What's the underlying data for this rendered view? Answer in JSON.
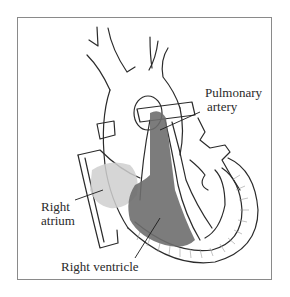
{
  "figure": {
    "labels": {
      "pulmonary_artery": [
        "Pulmonary",
        "artery"
      ],
      "right_atrium": [
        "Right",
        "atrium"
      ],
      "right_ventricle": "Right ventricle"
    },
    "colors": {
      "outline": "#2b2b2b",
      "frame": "#8a8a8a",
      "ventricle_fill": "#6e6e6e",
      "atrium_fill": "#cfcfcf"
    }
  }
}
